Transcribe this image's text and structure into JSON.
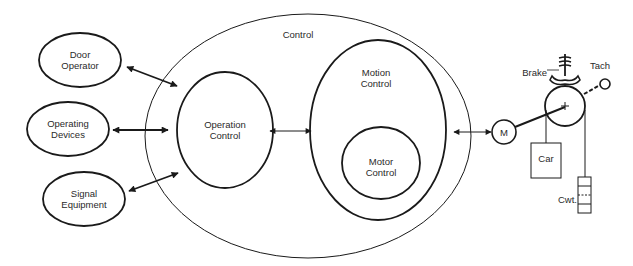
{
  "diagram": {
    "control_label": "Control",
    "external_nodes": [
      {
        "id": "door-operator",
        "line1": "Door",
        "line2": "Operator"
      },
      {
        "id": "operating-devices",
        "line1": "Operating",
        "line2": "Devices"
      },
      {
        "id": "signal-equipment",
        "line1": "Signal",
        "line2": "Equipment"
      }
    ],
    "operation_control": {
      "line1": "Operation",
      "line2": "Control"
    },
    "motion_control": {
      "line1": "Motion",
      "line2": "Control"
    },
    "motor_control": {
      "line1": "Motor",
      "line2": "Control"
    },
    "machine": {
      "motor_label": "M",
      "brake_label": "Brake",
      "tach_label": "Tach",
      "car_label": "Car",
      "counterweight_label": "Cwt."
    },
    "colors": {
      "stroke": "#1a1a1a",
      "text": "#2a2a2a",
      "background": "#ffffff"
    }
  }
}
